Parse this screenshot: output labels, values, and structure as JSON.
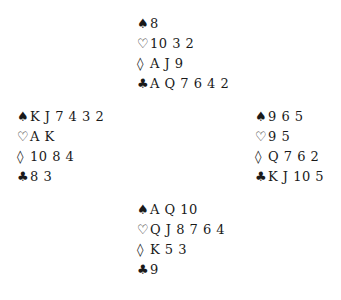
{
  "suits": {
    "spades": "♠",
    "hearts": "♡",
    "diamonds": "◊",
    "clubs": "♣"
  },
  "hands": {
    "north": {
      "spades": "8",
      "hearts": "10 3 2",
      "diamonds": "A J 9",
      "clubs": "A Q 7 6 4 2"
    },
    "west": {
      "spades": "K J 7 4 3 2",
      "hearts": "A K",
      "diamonds": "10 8 4",
      "clubs": "8 3"
    },
    "east": {
      "spades": "9 6 5",
      "hearts": "9 5",
      "diamonds": "Q 7 6 2",
      "clubs": "K J 10 5"
    },
    "south": {
      "spades": "A Q 10",
      "hearts": "Q J 8 7 6 4",
      "diamonds": "K 5 3",
      "clubs": "9"
    }
  }
}
